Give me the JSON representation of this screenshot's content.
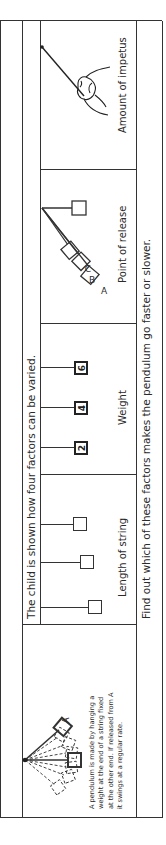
{
  "header": {
    "text": "The child is shown how four factors can be varied."
  },
  "caption": {
    "text": "Find out which of these factors makes the pendulum go faster or slower."
  },
  "intro_panel": {
    "release_label": "A",
    "description": "A pendulum is made by hanging a weight at the end of a string fixed at the other end. If released from A it swings at a regular rate."
  },
  "factors": [
    {
      "label": "Length of string"
    },
    {
      "label": "Weight",
      "weights": [
        "2",
        "4",
        "6"
      ]
    },
    {
      "label": "Point of release",
      "points": [
        "A",
        "B",
        "C"
      ]
    },
    {
      "label": "Amount of impetus"
    }
  ]
}
